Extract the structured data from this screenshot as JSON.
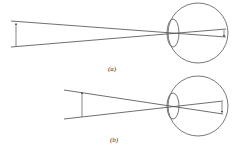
{
  "figure": {
    "panels": [
      {
        "id": "a",
        "label": "(a)",
        "description": "Distant object subtends a small visual angle, producing a small retinal image"
      },
      {
        "id": "b",
        "label": "(b)",
        "description": "Nearer object subtends a larger visual angle, producing a larger retinal image"
      }
    ],
    "colors": {
      "stroke": "#4a4a4a",
      "background": "#ffffff"
    }
  }
}
